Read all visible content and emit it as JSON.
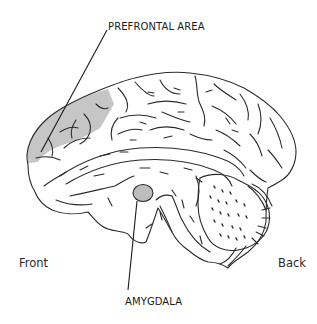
{
  "diagram": {
    "labels": {
      "prefrontal": "PREFRONTAL AREA",
      "amygdala": "AMYGDALA",
      "front": "Front",
      "back": "Back"
    },
    "colors": {
      "outline": "#2b2b2b",
      "highlight_fill": "#c6c6c6",
      "background": "#ffffff"
    }
  }
}
